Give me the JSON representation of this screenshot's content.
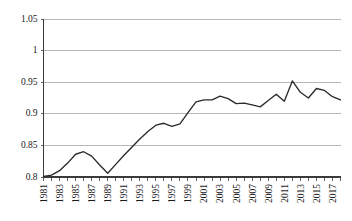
{
  "chart_data": {
    "type": "line",
    "title": "",
    "subtitle": "",
    "xlabel": "",
    "ylabel": "",
    "grid": true,
    "legend": false,
    "legend_position": "none",
    "line_color": "#2b2b2b",
    "grid_color": "#a6a6a6",
    "axis_color": "#3b3b3b",
    "background_color": "#ffffff",
    "ylim": [
      0.8,
      1.05
    ],
    "yticks": [
      0.8,
      0.85,
      0.9,
      0.95,
      1,
      1.05
    ],
    "ytick_labels": [
      "0.8",
      "0.85",
      "0.9",
      "0.95",
      "1",
      "1.05"
    ],
    "xlim": [
      1981,
      2018
    ],
    "xticks": [
      1981,
      1982,
      1983,
      1984,
      1985,
      1986,
      1987,
      1988,
      1989,
      1990,
      1991,
      1992,
      1993,
      1994,
      1995,
      1996,
      1997,
      1998,
      1999,
      2000,
      2001,
      2002,
      2003,
      2004,
      2005,
      2006,
      2007,
      2008,
      2009,
      2010,
      2011,
      2012,
      2013,
      2014,
      2015,
      2016,
      2017,
      2018
    ],
    "xtick_labels": [
      "1981",
      "1983",
      "1985",
      "1987",
      "1989",
      "1991",
      "1993",
      "1995",
      "1997",
      "1999",
      "2001",
      "2003",
      "2005",
      "2007",
      "2009",
      "2011",
      "2013",
      "2015",
      "2017"
    ],
    "xtick_label_years": [
      1981,
      1983,
      1985,
      1987,
      1989,
      1991,
      1993,
      1995,
      1997,
      1999,
      2001,
      2003,
      2005,
      2007,
      2009,
      2011,
      2013,
      2015,
      2017
    ],
    "xtick_label_rotation": -90,
    "x": [
      1981,
      1982,
      1983,
      1984,
      1985,
      1986,
      1987,
      1988,
      1989,
      1990,
      1991,
      1992,
      1993,
      1994,
      1995,
      1996,
      1997,
      1998,
      1999,
      2000,
      2001,
      2002,
      2003,
      2004,
      2005,
      2006,
      2007,
      2008,
      2009,
      2010,
      2011,
      2012,
      2013,
      2014,
      2015,
      2016,
      2017,
      2018
    ],
    "values": [
      0.801,
      0.803,
      0.81,
      0.822,
      0.836,
      0.84,
      0.833,
      0.819,
      0.806,
      0.82,
      0.834,
      0.847,
      0.86,
      0.872,
      0.882,
      0.885,
      0.88,
      0.884,
      0.902,
      0.919,
      0.922,
      0.922,
      0.928,
      0.924,
      0.916,
      0.917,
      0.914,
      0.911,
      0.921,
      0.931,
      0.92,
      0.952,
      0.934,
      0.925,
      0.94,
      0.937,
      0.927,
      0.922
    ],
    "series": [
      {
        "name": "series-1",
        "color": "#2b2b2b",
        "values": [
          0.801,
          0.803,
          0.81,
          0.822,
          0.836,
          0.84,
          0.833,
          0.819,
          0.806,
          0.82,
          0.834,
          0.847,
          0.86,
          0.872,
          0.882,
          0.885,
          0.88,
          0.884,
          0.902,
          0.919,
          0.922,
          0.922,
          0.928,
          0.924,
          0.916,
          0.917,
          0.914,
          0.911,
          0.921,
          0.931,
          0.92,
          0.952,
          0.934,
          0.925,
          0.94,
          0.937,
          0.927,
          0.922
        ]
      }
    ]
  }
}
